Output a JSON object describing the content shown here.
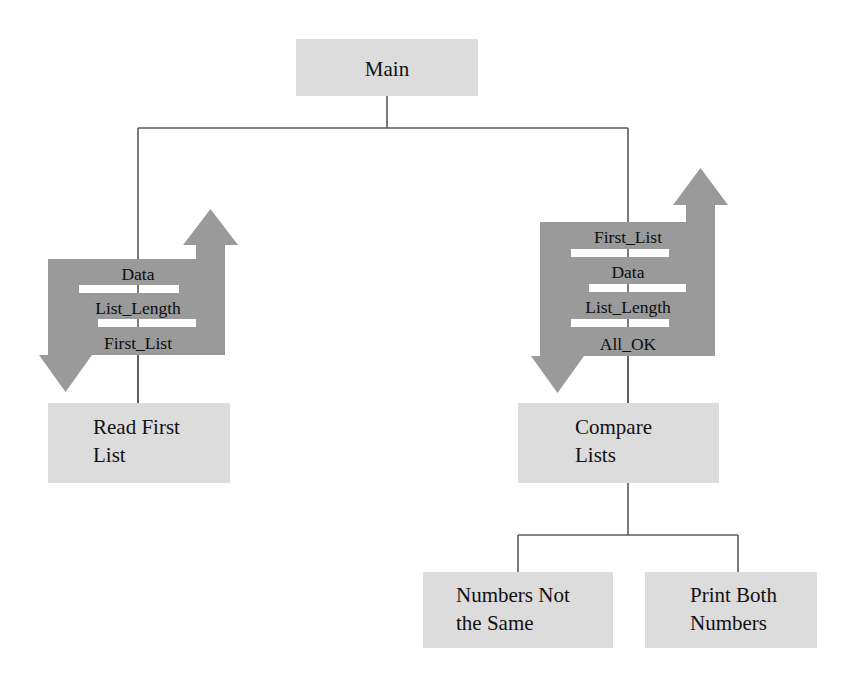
{
  "diagram": {
    "type": "structure-chart",
    "colors": {
      "box_fill": "#dcdcdc",
      "arrow_fill": "#9a9a9a",
      "line": "#5a5a5a",
      "text": "#111111",
      "background": "#ffffff"
    },
    "modules": [
      {
        "id": "main",
        "label": "Main",
        "lines": [
          "Main"
        ],
        "align": "center"
      },
      {
        "id": "read-first",
        "label": "Read First List",
        "lines": [
          "Read First",
          "List"
        ],
        "align": "left"
      },
      {
        "id": "compare-lists",
        "label": "Compare Lists",
        "lines": [
          "Compare",
          "Lists"
        ],
        "align": "left"
      },
      {
        "id": "numbers-not",
        "label": "Numbers Not the Same",
        "lines": [
          "Numbers Not",
          "the Same"
        ],
        "align": "left"
      },
      {
        "id": "print-both",
        "label": "Print Both Numbers",
        "lines": [
          "Print Both",
          "Numbers"
        ],
        "align": "left"
      }
    ],
    "couples_left": {
      "module": "read-first",
      "items": [
        {
          "name": "Data",
          "direction": "up"
        },
        {
          "name": "List_Length",
          "direction": "up"
        },
        {
          "name": "First_List",
          "direction": "up"
        }
      ]
    },
    "couples_right": {
      "module": "compare-lists",
      "items": [
        {
          "name": "First_List",
          "direction": "down"
        },
        {
          "name": "Data",
          "direction": "down"
        },
        {
          "name": "List_Length",
          "direction": "down"
        },
        {
          "name": "All_OK",
          "direction": "up"
        }
      ]
    },
    "connections": [
      {
        "from": "main",
        "to": "read-first"
      },
      {
        "from": "main",
        "to": "compare-lists"
      },
      {
        "from": "compare-lists",
        "to": "numbers-not"
      },
      {
        "from": "compare-lists",
        "to": "print-both"
      }
    ]
  }
}
